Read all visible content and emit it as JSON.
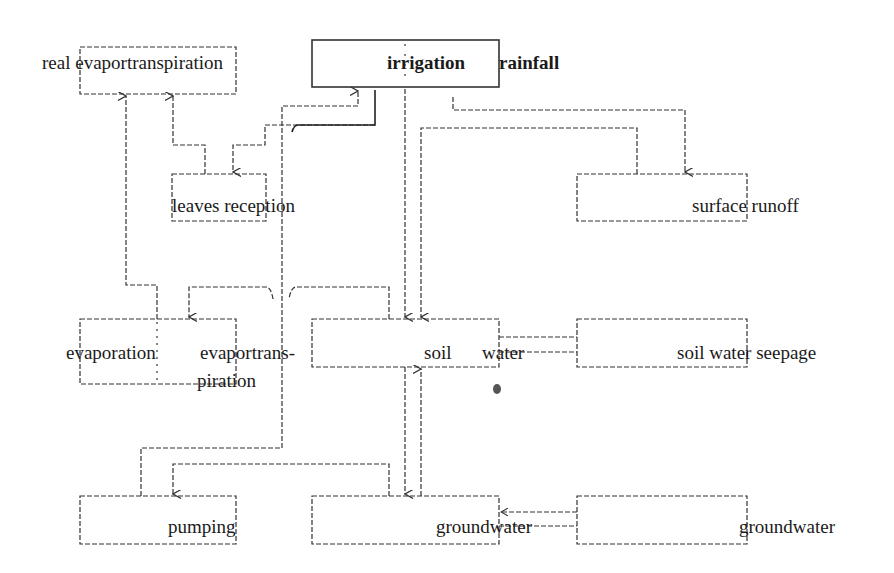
{
  "diagram": {
    "type": "water-balance flow diagram",
    "colors": {
      "line": "#333333",
      "text": "#1a1a1a",
      "background": "#ffffff"
    },
    "nodes": {
      "real_evapotranspiration": {
        "label": "real evaportranspiration"
      },
      "irrigation": {
        "label": "irrigation"
      },
      "rainfall": {
        "label": "rainfall"
      },
      "leaves_reception": {
        "label": "leaves reception"
      },
      "surface_runoff": {
        "label": "surface runoff"
      },
      "evaporation": {
        "label": "evaporation"
      },
      "evapotranspiration_line1": {
        "label": "evaportrans-"
      },
      "evapotranspiration_line2": {
        "label": "piration"
      },
      "soil": {
        "label": "soil"
      },
      "water": {
        "label": "water"
      },
      "soil_water_seepage": {
        "label": "soil water seepage"
      },
      "pumping": {
        "label": "pumping"
      },
      "groundwater_center": {
        "label": "groundwater"
      },
      "groundwater_right": {
        "label": "groundwater"
      }
    },
    "edges": [
      {
        "from": "irrigation_rainfall",
        "to": "leaves_reception"
      },
      {
        "from": "irrigation_rainfall",
        "to": "soil_water"
      },
      {
        "from": "irrigation_rainfall",
        "to": "surface_runoff"
      },
      {
        "from": "leaves_reception",
        "to": "real_evapotranspiration"
      },
      {
        "from": "evaporation",
        "to": "real_evapotranspiration"
      },
      {
        "from": "soil_water",
        "to": "evaporation_evapotranspiration"
      },
      {
        "from": "soil_water",
        "to": "soil_water_seepage"
      },
      {
        "from": "soil_water_seepage",
        "to": "soil_water"
      },
      {
        "from": "soil_water",
        "to": "groundwater_center"
      },
      {
        "from": "groundwater_center",
        "to": "soil_water"
      },
      {
        "from": "groundwater_center",
        "to": "pumping"
      },
      {
        "from": "pumping",
        "to": "irrigation"
      },
      {
        "from": "groundwater_right",
        "to": "groundwater_center"
      }
    ]
  }
}
